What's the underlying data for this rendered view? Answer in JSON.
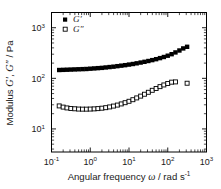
{
  "chart_data": {
    "type": "scatter",
    "title": "",
    "xlabel": "Angular frequency ω / rad s⁻¹",
    "ylabel": "Modulus G′, G″ / Pa",
    "xscale": "log",
    "yscale": "log",
    "xlim": [
      0.1,
      1000
    ],
    "ylim": [
      3.5,
      2000
    ],
    "grid": false,
    "legend_position": "top-left",
    "x_tick_labels": [
      "10⁻¹",
      "10⁰",
      "10¹",
      "10²",
      "10³"
    ],
    "x_tick_values": [
      0.1,
      1,
      10,
      100,
      1000
    ],
    "y_tick_labels": [
      "10¹",
      "10²",
      "10³"
    ],
    "y_tick_values": [
      10,
      100,
      1000
    ],
    "series": [
      {
        "name": "G′",
        "marker": "filled-square",
        "x": [
          0.158,
          0.2,
          0.251,
          0.316,
          0.398,
          0.501,
          0.631,
          0.794,
          1.0,
          1.26,
          1.58,
          2.0,
          2.51,
          3.16,
          3.98,
          5.01,
          6.31,
          7.94,
          10.0,
          12.6,
          15.8,
          20.0,
          25.1,
          31.6,
          39.8,
          50.1,
          63.1,
          79.4,
          100.0,
          126.0,
          158.0,
          200.0,
          251.0,
          316.0
        ],
        "y": [
          146,
          147,
          148,
          149,
          150,
          151,
          152,
          153,
          155,
          157,
          159,
          161,
          164,
          167,
          170,
          174,
          178,
          182,
          187,
          192,
          198,
          205,
          212,
          220,
          229,
          239,
          251,
          264,
          280,
          300,
          325,
          355,
          390,
          420
        ]
      },
      {
        "name": "G″",
        "marker": "open-square",
        "x": [
          0.158,
          0.2,
          0.251,
          0.316,
          0.398,
          0.501,
          0.631,
          0.794,
          1.0,
          1.26,
          1.58,
          2.0,
          2.51,
          3.16,
          3.98,
          5.01,
          6.31,
          7.94,
          10.0,
          12.6,
          15.8,
          20.0,
          25.1,
          31.6,
          39.8,
          50.1,
          63.1,
          79.4,
          100.0,
          126.0,
          158.0,
          316.0
        ],
        "y": [
          28.5,
          27.0,
          26.0,
          25.4,
          25.0,
          24.7,
          24.6,
          24.6,
          24.7,
          24.9,
          25.2,
          25.7,
          26.3,
          27.2,
          28.3,
          29.6,
          31.2,
          33.0,
          35.2,
          37.8,
          41.0,
          44.5,
          48.5,
          53.0,
          58.0,
          63.0,
          68.5,
          74.0,
          79.0,
          84.0,
          85.0,
          80.0
        ]
      }
    ]
  },
  "legend": {
    "entries": [
      {
        "label": "G′",
        "marker": "filled-square"
      },
      {
        "label": "G″",
        "marker": "open-square"
      }
    ]
  },
  "axis_titles": {
    "y_prefix": "Modulus ",
    "y_italic_1": "G′",
    "y_mid": ", ",
    "y_italic_2": "G″",
    "y_suffix": " / Pa",
    "x_prefix": "Angular frequency ",
    "x_italic": "ω",
    "x_mid": " / rad s",
    "x_sup": "-1"
  }
}
